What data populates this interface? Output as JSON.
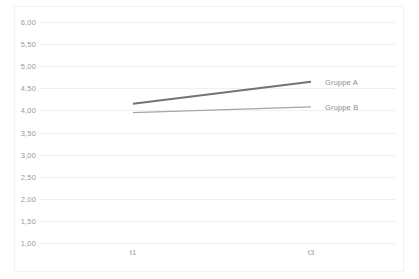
{
  "chart_data": {
    "type": "line",
    "title": "",
    "subtitle": "",
    "xlabel": "",
    "ylabel": "",
    "categories": [
      "t1",
      "t3"
    ],
    "x": [
      0,
      1
    ],
    "series": [
      {
        "name": "Gruppe A",
        "values": [
          4.15,
          4.65
        ],
        "color": "#737373",
        "width": 2.0
      },
      {
        "name": "Gruppe B",
        "values": [
          3.95,
          4.08
        ],
        "color": "#a6a6a6",
        "width": 1.2
      }
    ],
    "ylim": [
      1.0,
      6.0
    ],
    "ytick_step": 0.5,
    "ytick_labels": [
      "6,00",
      "5,50",
      "5,00",
      "4,50",
      "4,00",
      "3,50",
      "3,00",
      "2,50",
      "2,00",
      "1,50",
      "1,00"
    ],
    "ytick_values": [
      6.0,
      5.5,
      5.0,
      4.5,
      4.0,
      3.5,
      3.0,
      2.5,
      2.0,
      1.5,
      1.0
    ],
    "xtick_labels": [
      "t1",
      "t3"
    ],
    "grid": true,
    "grid_axis": "y",
    "grid_color": "#f0f0f0",
    "legend": "inline-end-labels",
    "legend_position": "right",
    "background_color": "#ffffff",
    "frame_color": "#f2f2f2",
    "tick_label_color": "#9a9a9a",
    "decimal_separator": ","
  }
}
